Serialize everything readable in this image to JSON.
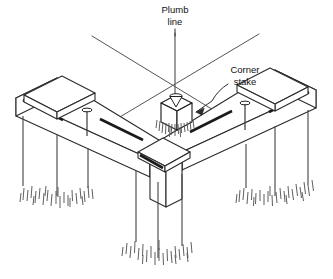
{
  "figure": {
    "type": "isometric-line-diagram",
    "background_color": "#ffffff",
    "line_color": "#2b2b2b",
    "accent_line_color": "#555555",
    "groove_color": "#1a1a1a"
  },
  "labels": {
    "plumb_line": {
      "line1": "Plumb",
      "line2": "line",
      "x": 174,
      "y": 14
    },
    "corner_stake": {
      "line1": "Corner",
      "line2": "stake",
      "x": 243,
      "y": 74
    }
  },
  "parts": {
    "plumb_line_name": "plumb-line",
    "plumb_bob_name": "plumb-bob",
    "corner_stake_name": "corner-stake",
    "left_batter_board_name": "left-batter-board",
    "right_batter_board_name": "right-batter-board",
    "left_cap_block_name": "left-cap-block",
    "right_cap_block_name": "right-cap-block",
    "center_cap_block_name": "center-cap-block",
    "left_nail_name": "left-nail",
    "right_nail_name": "right-nail",
    "string_line_left_name": "string-line-left",
    "string_line_right_name": "string-line-right",
    "support_posts_name": "support-posts",
    "ground_grass_name": "ground-grass"
  },
  "geometry": {
    "string_left": {
      "x1": 92,
      "y1": 36,
      "x2": 232,
      "y2": 121
    },
    "string_right": {
      "x1": 258,
      "y1": 34,
      "x2": 88,
      "y2": 135
    },
    "plumb_drop": {
      "x": 175,
      "y1": 33,
      "y2": 96
    },
    "cross_point": {
      "x": 175,
      "y": 91
    },
    "stake_box": {
      "cx": 175,
      "cy": 110,
      "w": 26,
      "h": 22
    }
  }
}
